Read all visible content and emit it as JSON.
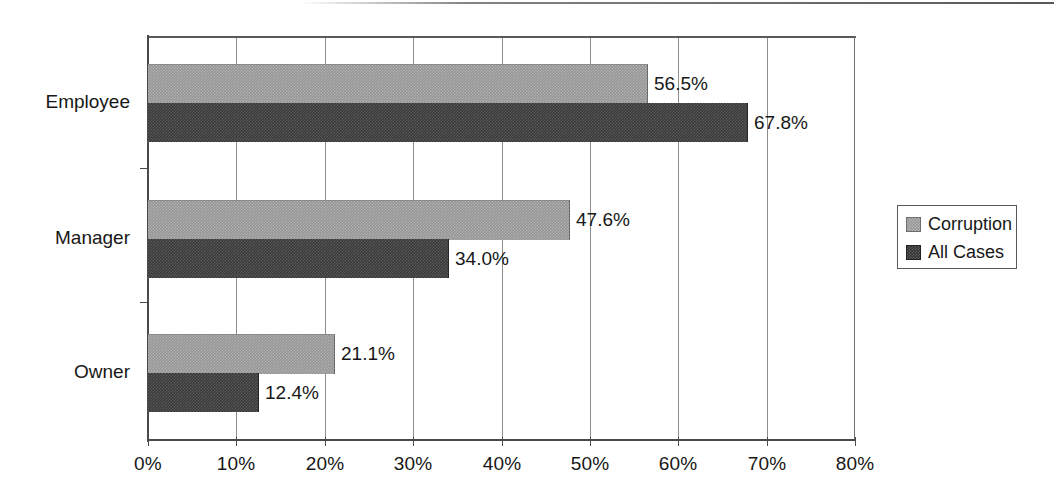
{
  "chart_data": {
    "type": "bar",
    "orientation": "horizontal",
    "title": "",
    "xlabel": "",
    "ylabel": "",
    "categories": [
      "Employee",
      "Manager",
      "Owner"
    ],
    "series": [
      {
        "name": "Corruption",
        "color": "#969696",
        "values": [
          56.5,
          47.6,
          21.1
        ],
        "value_labels": [
          "56.5%",
          "47.6%",
          "21.1%"
        ]
      },
      {
        "name": "All Cases",
        "color": "#3a3a3a",
        "values": [
          67.8,
          34.0,
          12.4
        ],
        "value_labels": [
          "67.8%",
          "34.0%",
          "12.4%"
        ]
      }
    ],
    "xlim": [
      0,
      80
    ],
    "xticks": [
      0,
      10,
      20,
      30,
      40,
      50,
      60,
      70,
      80
    ],
    "xtick_labels": [
      "0%",
      "10%",
      "20%",
      "30%",
      "40%",
      "50%",
      "60%",
      "70%",
      "80%"
    ],
    "grid": "vertical",
    "legend_position": "right"
  },
  "legend": {
    "items": [
      {
        "label": "Corruption"
      },
      {
        "label": "All Cases"
      }
    ]
  }
}
